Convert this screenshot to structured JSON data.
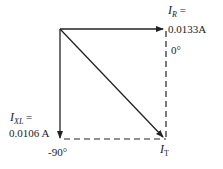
{
  "diagram": {
    "type": "phasor-diagram",
    "vectors": [
      {
        "name": "I_R",
        "angle_deg": 0,
        "magnitude": "0.0133 A",
        "direction": "right"
      },
      {
        "name": "I_XL",
        "angle_deg": -90,
        "magnitude": "0.0106 A",
        "direction": "down"
      },
      {
        "name": "I_T",
        "direction": "diagonal-down-right"
      }
    ],
    "labels": {
      "ir_symbol": "I",
      "ir_sub": "R",
      "ir_eq": " =",
      "ir_value": "0.0133A",
      "ir_angle": "0°",
      "ixl_symbol": "I",
      "ixl_sub": "XL",
      "ixl_eq": " =",
      "ixl_value": "0.0106 A",
      "ixl_angle": "-90°",
      "it_symbol": "I",
      "it_sub": "T"
    }
  }
}
